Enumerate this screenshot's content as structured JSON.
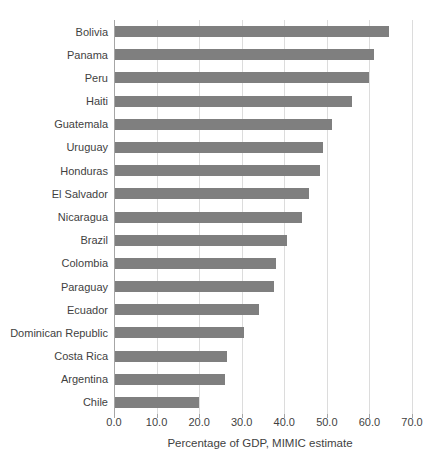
{
  "chart_data": {
    "type": "bar",
    "orientation": "horizontal",
    "xlabel": "Percentage of GDP, MIMIC estimate",
    "categories": [
      "Bolivia",
      "Panama",
      "Peru",
      "Haiti",
      "Guatemala",
      "Uruguay",
      "Honduras",
      "El Salvador",
      "Nicaragua",
      "Brazil",
      "Colombia",
      "Paraguay",
      "Ecuador",
      "Dominican Republic",
      "Costa Rica",
      "Argentina",
      "Chile"
    ],
    "values": [
      64.4,
      60.8,
      59.7,
      55.7,
      51.0,
      48.9,
      48.2,
      45.6,
      43.9,
      40.5,
      37.8,
      37.3,
      33.8,
      30.3,
      26.3,
      25.8,
      19.7
    ],
    "x_ticks": [
      "0.0",
      "10.0",
      "20.0",
      "30.0",
      "40.0",
      "50.0",
      "60.0",
      "70.0"
    ],
    "x_tick_values": [
      0,
      10,
      20,
      30,
      40,
      50,
      60,
      70
    ],
    "xlim": [
      0,
      70
    ],
    "grid": true,
    "legend": false,
    "bar_color": "#7f7f7f",
    "gridline_color": "#dcdcdc",
    "axis_line_color": "#a6a6a6",
    "text_color": "#3f3f3f"
  }
}
